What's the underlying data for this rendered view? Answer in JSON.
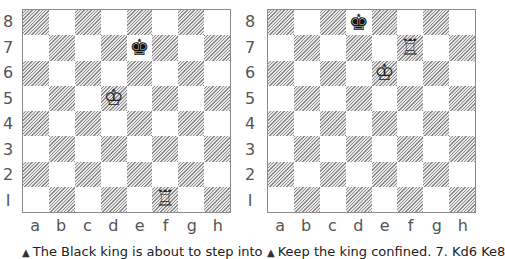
{
  "ranks": [
    "8",
    "7",
    "6",
    "5",
    "4",
    "3",
    "2",
    "1"
  ],
  "files": [
    "a",
    "b",
    "c",
    "d",
    "e",
    "f",
    "g",
    "h"
  ],
  "diagrams": [
    {
      "caption_marker": "▲",
      "caption": "The Black king is about to step into",
      "pieces": [
        {
          "square": "e7",
          "piece": "king",
          "color": "black",
          "glyph": "♚"
        },
        {
          "square": "d5",
          "piece": "king",
          "color": "white",
          "glyph": "♔"
        },
        {
          "square": "f1",
          "piece": "rook",
          "color": "white",
          "glyph": "♖"
        }
      ]
    },
    {
      "caption_marker": "▲",
      "caption": "Keep the king confined. 7. Kd6 Ke8",
      "pieces": [
        {
          "square": "d8",
          "piece": "king",
          "color": "black",
          "glyph": "♚"
        },
        {
          "square": "f7",
          "piece": "rook",
          "color": "white",
          "glyph": "♖"
        },
        {
          "square": "e6",
          "piece": "king",
          "color": "white",
          "glyph": "♔"
        }
      ]
    }
  ],
  "colors": {
    "light_square": "#ffffff",
    "dark_square_hatch": "#8c8c8c",
    "border": "#8a8a8a",
    "label_text": "#555555"
  }
}
